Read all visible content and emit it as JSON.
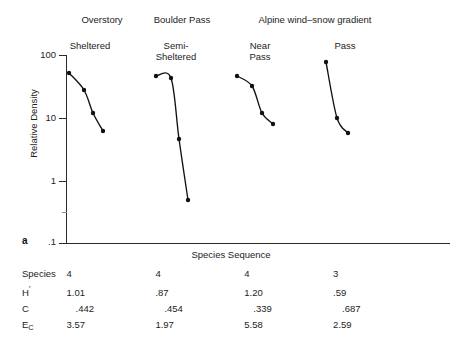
{
  "figure": {
    "panel_tag": "a",
    "ylabel": "Relative Density",
    "xlabel": "Species Sequence",
    "y_ticks": [
      "100",
      "10",
      "1",
      ".1"
    ]
  },
  "groups": [
    {
      "label": "Overstory"
    },
    {
      "label": "Boulder Pass"
    },
    {
      "label": "Alpine wind–snow gradient"
    }
  ],
  "sites": [
    {
      "label": "Sheltered"
    },
    {
      "label": "Semi-\nSheltered"
    },
    {
      "label": "Near\nPass"
    },
    {
      "label": "Pass"
    }
  ],
  "stats": {
    "row_labels": [
      "Species",
      "H′",
      "C",
      "E_C"
    ],
    "rows": [
      {
        "label": "Species",
        "values": [
          "4",
          "4",
          "4",
          "3"
        ]
      },
      {
        "label": "H′",
        "values": [
          "1.01",
          ".87",
          "1.20",
          ".59"
        ]
      },
      {
        "label": "C",
        "values": [
          ".442",
          ".454",
          ".339",
          ".687"
        ]
      },
      {
        "label": "E_C",
        "values": [
          "3.57",
          "1.97",
          "5.58",
          "2.59"
        ]
      }
    ]
  },
  "chart_data": {
    "type": "line",
    "title": "",
    "xlabel": "Species Sequence",
    "ylabel": "Relative Density",
    "yscale": "log",
    "ylim": [
      0.1,
      100
    ],
    "ytick_values": [
      100,
      10,
      1,
      0.1
    ],
    "ytick_labels": [
      "100",
      "10",
      "1",
      ".1"
    ],
    "grid": false,
    "legend": "none",
    "series": [
      {
        "name": "Sheltered",
        "group": "Overstory",
        "x": [
          1,
          2,
          3,
          4
        ],
        "values": [
          50,
          22,
          7.5,
          4.6
        ]
      },
      {
        "name": "Semi-Sheltered",
        "group": "Boulder Pass",
        "x": [
          1,
          2,
          3,
          4
        ],
        "values": [
          40,
          38,
          4.3,
          0.48
        ]
      },
      {
        "name": "Near Pass",
        "group": "Alpine wind-snow gradient",
        "x": [
          1,
          2,
          3,
          4
        ],
        "values": [
          40,
          27,
          9.6,
          7.6
        ]
      },
      {
        "name": "Pass",
        "group": "Alpine wind-snow gradient",
        "x": [
          1,
          2,
          3
        ],
        "values": [
          75,
          9.5,
          5.3
        ]
      }
    ]
  },
  "plot_geometry": {
    "comment": "pixel coordinates used to draw the curves",
    "series_points": [
      [
        [
          69,
          73
        ],
        [
          84,
          90
        ],
        [
          93,
          113
        ],
        [
          103,
          131
        ]
      ],
      [
        [
          156,
          76
        ],
        [
          171,
          78
        ],
        [
          179,
          139
        ],
        [
          188,
          200
        ]
      ],
      [
        [
          237,
          76
        ],
        [
          252,
          86
        ],
        [
          262,
          113
        ],
        [
          273,
          124
        ]
      ],
      [
        [
          326,
          62
        ],
        [
          337,
          118
        ],
        [
          348,
          133
        ]
      ]
    ]
  }
}
